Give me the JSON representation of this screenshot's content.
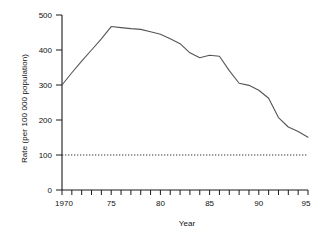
{
  "chart_data": {
    "type": "line",
    "title": "",
    "xlabel": "Year",
    "ylabel": "Rate (per 100 000 population)",
    "xlim": [
      1970,
      1995
    ],
    "ylim": [
      0,
      500
    ],
    "yticks": [
      0,
      100,
      200,
      300,
      400,
      500
    ],
    "ytick_labels": [
      "0",
      "100",
      "200",
      "300",
      "400",
      "500"
    ],
    "xticks": [
      1970,
      1975,
      1980,
      1985,
      1990,
      1995
    ],
    "xtick_labels": [
      "1970",
      "75",
      "80",
      "85",
      "90",
      "95"
    ],
    "xminor_tick_interval": 1,
    "grid": false,
    "legend": null,
    "line_color": "#555555",
    "axis_color": "#1a1a1a",
    "reference_line": {
      "y": 100,
      "style": "dotted",
      "color": "#333333",
      "label": ""
    },
    "x": [
      1970,
      1971,
      1972,
      1973,
      1974,
      1975,
      1976,
      1977,
      1978,
      1979,
      1980,
      1981,
      1982,
      1983,
      1984,
      1985,
      1986,
      1987,
      1988,
      1989,
      1990,
      1991,
      1992,
      1993,
      1994,
      1995
    ],
    "values": [
      300,
      335,
      368,
      400,
      432,
      467,
      464,
      461,
      459,
      452,
      445,
      432,
      418,
      392,
      378,
      385,
      382,
      341,
      305,
      299,
      285,
      262,
      207,
      180,
      167,
      151
    ],
    "series": [
      {
        "name": "Rate",
        "values": [
          300,
          335,
          368,
          400,
          432,
          467,
          464,
          461,
          459,
          452,
          445,
          432,
          418,
          392,
          378,
          385,
          382,
          341,
          305,
          299,
          285,
          262,
          207,
          180,
          167,
          151
        ]
      }
    ]
  }
}
